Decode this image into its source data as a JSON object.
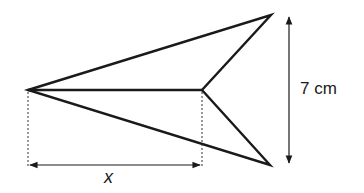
{
  "figure": {
    "shape": {
      "vertices": {
        "tip": [
          28,
          90
        ],
        "top": [
          271,
          15
        ],
        "inner": [
          202,
          90
        ],
        "bottom": [
          270,
          165
        ]
      },
      "stroke_color": "#1a1a1a"
    },
    "dimensions": {
      "height": {
        "label": "7 cm",
        "value": 7,
        "unit": "cm"
      },
      "width": {
        "label": "x"
      }
    }
  }
}
